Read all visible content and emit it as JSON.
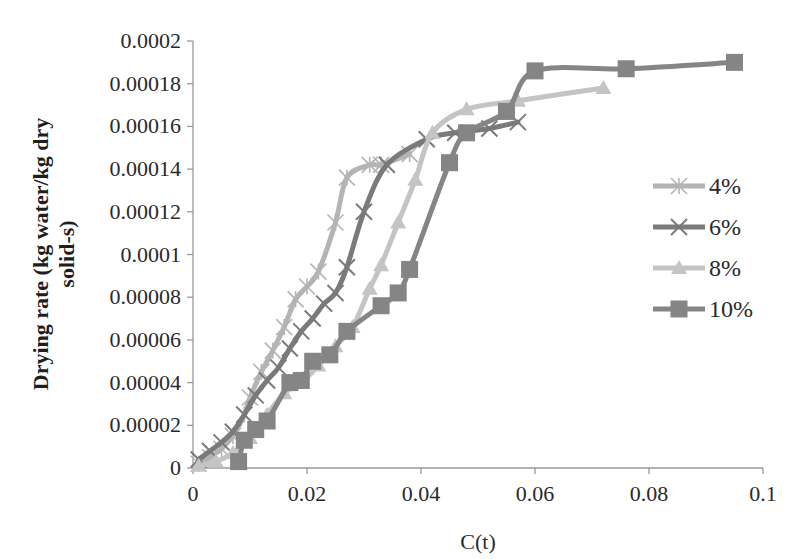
{
  "chart_data": {
    "type": "line",
    "title": "",
    "xlabel": "C(t)",
    "ylabel_lines": [
      "Drying rate (kg water/kg dry",
      "solid-s)"
    ],
    "ylabel": "Drying rate (kg water/kg dry solid-s)",
    "xlim": [
      0,
      0.1
    ],
    "ylim": [
      0,
      0.0002
    ],
    "x_ticks": [
      0,
      0.02,
      0.04,
      0.06,
      0.08,
      0.1
    ],
    "x_tick_labels": [
      "0",
      "0.02",
      "0.04",
      "0.06",
      "0.08",
      "0.1"
    ],
    "y_ticks": [
      0,
      2e-05,
      4e-05,
      6e-05,
      8e-05,
      0.0001,
      0.00012,
      0.00014,
      0.00016,
      0.00018,
      0.0002
    ],
    "y_tick_labels": [
      "0",
      "0.00002",
      "0.00004",
      "0.00006",
      "0.00008",
      "0.0001",
      "0.00012",
      "0.00014",
      "0.00016",
      "0.00018",
      "0.0002"
    ],
    "grid": false,
    "legend_position": "right",
    "series": [
      {
        "name": "4%",
        "marker": "asterisk",
        "color": "#b4b4b4",
        "x": [
          0.001,
          0.003,
          0.005,
          0.007,
          0.009,
          0.01,
          0.012,
          0.014,
          0.016,
          0.018,
          0.02,
          0.022,
          0.025,
          0.027,
          0.031,
          0.033,
          0.038
        ],
        "y": [
          2e-06,
          5e-06,
          9e-06,
          1.5e-05,
          2.5e-05,
          3.3e-05,
          4.5e-05,
          5.5e-05,
          6.6e-05,
          7.9e-05,
          8.5e-05,
          9.2e-05,
          0.000115,
          0.000136,
          0.000142,
          0.000142,
          0.000147
        ]
      },
      {
        "name": "6%",
        "marker": "x",
        "color": "#7a7a7a",
        "x": [
          0.001,
          0.003,
          0.005,
          0.007,
          0.009,
          0.011,
          0.013,
          0.015,
          0.017,
          0.019,
          0.021,
          0.023,
          0.025,
          0.027,
          0.03,
          0.034,
          0.041,
          0.046,
          0.052,
          0.057
        ],
        "y": [
          4e-06,
          8e-06,
          1.2e-05,
          1.7e-05,
          2.5e-05,
          3.4e-05,
          4.1e-05,
          4.7e-05,
          5.6e-05,
          6.4e-05,
          7e-05,
          7.7e-05,
          8.2e-05,
          9.4e-05,
          0.00012,
          0.000142,
          0.000154,
          0.000157,
          0.000159,
          0.000162
        ]
      },
      {
        "name": "8%",
        "marker": "triangle",
        "color": "#c4c4c4",
        "x": [
          0.001,
          0.004,
          0.007,
          0.01,
          0.013,
          0.016,
          0.019,
          0.022,
          0.025,
          0.028,
          0.031,
          0.033,
          0.036,
          0.039,
          0.042,
          0.048,
          0.057,
          0.072
        ],
        "y": [
          1e-06,
          3e-06,
          7e-06,
          1.4e-05,
          2.5e-05,
          3.5e-05,
          4e-05,
          4.8e-05,
          5.7e-05,
          6.6e-05,
          8.4e-05,
          9.5e-05,
          0.000115,
          0.000135,
          0.000157,
          0.000168,
          0.000172,
          0.000178
        ]
      },
      {
        "name": "10%",
        "marker": "square",
        "color": "#858585",
        "x": [
          0.008,
          0.009,
          0.011,
          0.013,
          0.017,
          0.019,
          0.021,
          0.024,
          0.027,
          0.033,
          0.036,
          0.038,
          0.045,
          0.048,
          0.055,
          0.06,
          0.076,
          0.095
        ],
        "y": [
          3e-06,
          1.3e-05,
          1.8e-05,
          2.2e-05,
          4e-05,
          4.1e-05,
          5e-05,
          5.3e-05,
          6.4e-05,
          7.6e-05,
          8.2e-05,
          9.3e-05,
          0.000143,
          0.000157,
          0.000167,
          0.000186,
          0.000187,
          0.00019
        ]
      }
    ]
  }
}
